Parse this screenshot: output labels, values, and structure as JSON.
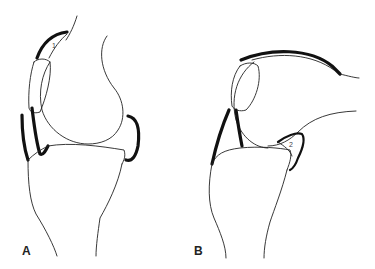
{
  "figure": {
    "type": "anatomical line drawing",
    "panels": [
      {
        "label": "A",
        "description": "knee in extension",
        "callout": "1"
      },
      {
        "label": "B",
        "description": "knee in flexion",
        "callout": "2"
      }
    ],
    "colors": {
      "line": "#222222",
      "background": "#ffffff"
    }
  }
}
